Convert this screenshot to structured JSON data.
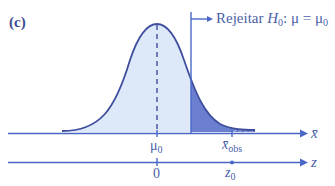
{
  "panel_label": "(c)",
  "annotation": {
    "prefix": "Rejeitar ",
    "h": "H",
    "h_sub": "0",
    "eq": ": μ = μ",
    "mu_sub": "0"
  },
  "axes": {
    "xbar_axis": {
      "name": "x̄",
      "ticks": [
        {
          "main": "μ",
          "sub": "0"
        },
        {
          "main": "x̄",
          "sub": "obs"
        }
      ]
    },
    "z_axis": {
      "name": "z",
      "ticks": [
        {
          "main": "0",
          "sub": ""
        },
        {
          "main": "z",
          "sub": "0"
        }
      ]
    }
  },
  "colors": {
    "curve": "#3f4f9e",
    "fill_light": "#dde9f8",
    "fill_reject": "#6b7fd0",
    "axis": "#4a67c8",
    "text": "#4a5fa8"
  }
}
